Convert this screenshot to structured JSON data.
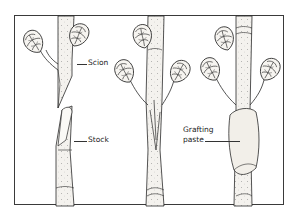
{
  "diagram": {
    "type": "botanical-illustration",
    "panels": [
      {
        "id": "panel-1",
        "description": "separate scion and stock",
        "labels": [
          "Scion",
          "Stock"
        ]
      },
      {
        "id": "panel-2",
        "description": "scion inserted into stock",
        "labels": []
      },
      {
        "id": "panel-3",
        "description": "graft union covered in grafting paste",
        "labels": [
          "Grafting paste"
        ]
      }
    ]
  },
  "labels": {
    "scion": "Scion",
    "stock": "Stock",
    "grafting_paste_line1": "Grafting",
    "grafting_paste_line2": "paste"
  },
  "colors": {
    "ink": "#2a2a2a",
    "bark": "#f4f2ee",
    "paste": "#f2efe9",
    "frame": "#3a3a3a"
  }
}
